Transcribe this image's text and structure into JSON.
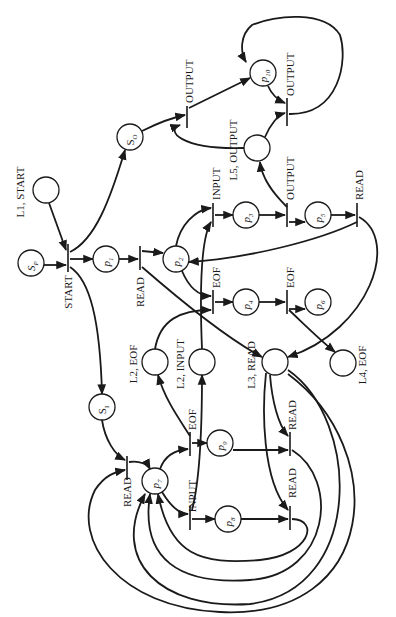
{
  "diagram": {
    "type": "petri-net",
    "orientation": "rotated-90-ccw",
    "colors": {
      "stroke": "#1a1a1a",
      "background": "#ffffff"
    },
    "places": [
      {
        "id": "SP",
        "label": "S",
        "sub": "P",
        "x": 31,
        "y": 263
      },
      {
        "id": "SO",
        "label": "S",
        "sub": "O",
        "x": 130,
        "y": 137
      },
      {
        "id": "SI",
        "label": "S",
        "sub": "I",
        "x": 102,
        "y": 407
      },
      {
        "id": "p1",
        "label": "p",
        "sub": "1",
        "x": 106,
        "y": 259
      },
      {
        "id": "p2",
        "label": "p",
        "sub": "2",
        "x": 176,
        "y": 259
      },
      {
        "id": "p3",
        "label": "p",
        "sub": "3",
        "x": 246,
        "y": 215
      },
      {
        "id": "p4",
        "label": "p",
        "sub": "4",
        "x": 246,
        "y": 302
      },
      {
        "id": "p5",
        "label": "p",
        "sub": "5",
        "x": 318,
        "y": 215
      },
      {
        "id": "p6",
        "label": "p",
        "sub": "6",
        "x": 318,
        "y": 302
      },
      {
        "id": "p7",
        "label": "p",
        "sub": "7",
        "x": 155,
        "y": 481
      },
      {
        "id": "p8",
        "label": "p",
        "sub": "8",
        "x": 228,
        "y": 519
      },
      {
        "id": "p9",
        "label": "p",
        "sub": "9",
        "x": 220,
        "y": 443
      },
      {
        "id": "p10",
        "label": "p",
        "sub": "10",
        "x": 263,
        "y": 73
      },
      {
        "id": "L1",
        "label": "",
        "x": 46,
        "y": 190
      },
      {
        "id": "L5",
        "label": "",
        "x": 257,
        "y": 148
      },
      {
        "id": "L2EOF",
        "label": "",
        "x": 155,
        "y": 362
      },
      {
        "id": "L2IN",
        "label": "",
        "x": 202,
        "y": 362
      },
      {
        "id": "L3",
        "label": "",
        "x": 275,
        "y": 362
      },
      {
        "id": "L4",
        "label": "",
        "x": 343,
        "y": 363
      }
    ],
    "place_labels": [
      {
        "text": "L1, START",
        "x": 24,
        "y": 192
      },
      {
        "text": "L5, OUTPUT",
        "x": 237,
        "y": 150
      },
      {
        "text": "L2, EOF",
        "x": 137,
        "y": 364
      },
      {
        "text": "L2, INPUT",
        "x": 184,
        "y": 364
      },
      {
        "text": "L3, READ",
        "x": 255,
        "y": 365
      },
      {
        "text": "L4, EOF",
        "x": 366,
        "y": 365
      }
    ],
    "transitions": [
      {
        "id": "t-start",
        "label": "START",
        "x": 68,
        "y": 258
      },
      {
        "id": "t-read1",
        "label": "READ",
        "x": 140,
        "y": 258
      },
      {
        "id": "t-input1",
        "label": "INPUT",
        "x": 213,
        "y": 215
      },
      {
        "id": "t-eof1",
        "label": "EOF",
        "x": 213,
        "y": 302
      },
      {
        "id": "t-output1",
        "label": "OUTPUT",
        "x": 287,
        "y": 215
      },
      {
        "id": "t-eof2",
        "label": "EOF",
        "x": 287,
        "y": 302
      },
      {
        "id": "t-read2",
        "label": "READ",
        "x": 357,
        "y": 215
      },
      {
        "id": "t-output-so",
        "label": "OUTPUT",
        "x": 187,
        "y": 117
      },
      {
        "id": "t-output-p10",
        "label": "OUTPUT",
        "x": 287,
        "y": 72
      },
      {
        "id": "t-read-si",
        "label": "READ",
        "x": 127,
        "y": 470
      },
      {
        "id": "t-eof-p7",
        "label": "EOF",
        "x": 190,
        "y": 443
      },
      {
        "id": "t-input-p7",
        "label": "INPUT",
        "x": 190,
        "y": 519
      },
      {
        "id": "t-read-p9",
        "label": "READ",
        "x": 290,
        "y": 443
      },
      {
        "id": "t-read-p8",
        "label": "READ",
        "x": 290,
        "y": 519
      }
    ]
  }
}
